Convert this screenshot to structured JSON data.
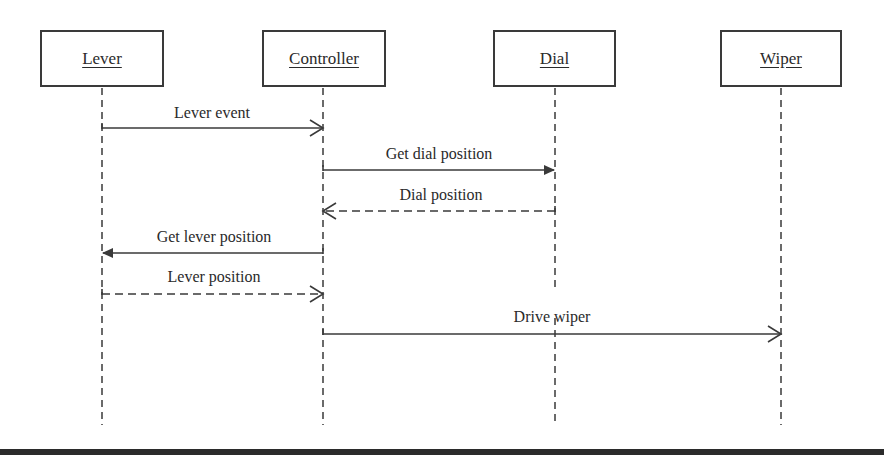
{
  "diagram": {
    "type": "UML sequence diagram",
    "actors": [
      {
        "id": "lever",
        "label": "Lever",
        "x": 102,
        "box_left": 40,
        "box_width": 124
      },
      {
        "id": "controller",
        "label": "Controller",
        "x": 323,
        "box_left": 262,
        "box_width": 124
      },
      {
        "id": "dial",
        "label": "Dial",
        "x": 555,
        "box_left": 493,
        "box_width": 123
      },
      {
        "id": "wiper",
        "label": "Wiper",
        "x": 781,
        "box_left": 720,
        "box_width": 122
      }
    ],
    "messages": [
      {
        "label": "Lever event",
        "from": "lever",
        "to": "controller",
        "style": "solid",
        "arrow": "open",
        "y": 128
      },
      {
        "label": "Get dial position",
        "from": "controller",
        "to": "dial",
        "style": "solid",
        "arrow": "filled",
        "y": 170
      },
      {
        "label": "Dial position",
        "from": "dial",
        "to": "controller",
        "style": "dashed",
        "arrow": "open",
        "y": 211
      },
      {
        "label": "Get lever position",
        "from": "controller",
        "to": "lever",
        "style": "solid",
        "arrow": "filled",
        "y": 253
      },
      {
        "label": "Lever position",
        "from": "lever",
        "to": "controller",
        "style": "dashed",
        "arrow": "open",
        "y": 294
      },
      {
        "label": "Drive wiper",
        "from": "controller",
        "to": "wiper",
        "style": "solid",
        "arrow": "open",
        "y": 334
      }
    ],
    "colors": {
      "line": "#3a3a3a",
      "text": "#2a2a2a",
      "background": "#ffffff",
      "bar": "#2b2b2b"
    }
  }
}
